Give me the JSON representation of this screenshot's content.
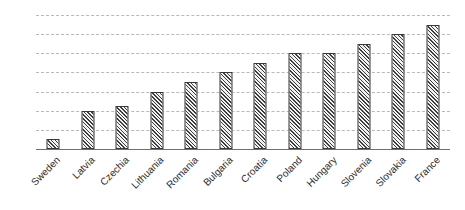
{
  "chart_data": {
    "type": "bar",
    "title": "",
    "subtitle": "",
    "xlabel": "",
    "ylabel": "",
    "categories": [
      "Sweden",
      "Latvia",
      "Czechia",
      "Lithuania",
      "Romania",
      "Bulgaria",
      "Croatia",
      "Poland",
      "Hungary",
      "Slovenia",
      "Slovakia",
      "France"
    ],
    "values": [
      1,
      4,
      4.5,
      6,
      7,
      8,
      9,
      10,
      10,
      11,
      12,
      13
    ],
    "ylim": [
      0,
      14
    ],
    "ytick_values": [
      0,
      2,
      4,
      6,
      8,
      10,
      12,
      14
    ],
    "ytick_labels": [
      "0",
      "2",
      "4",
      "6",
      "8",
      "10",
      "12",
      "14"
    ],
    "grid": "horizontal-dashed",
    "legend": "none",
    "annotations": [],
    "series": [
      {
        "name": "",
        "values": [
          1,
          4,
          4.5,
          6,
          7,
          8,
          9,
          10,
          10,
          11,
          12,
          13
        ]
      }
    ]
  },
  "style": {
    "bar_fill": "#f2f2f2",
    "bar_hatch_color": "#3d3d3d",
    "bar_border": "#3a3a3a",
    "gridline_color": "#b9b9b9",
    "axis_color": "#6f6f6f",
    "text_color": "#2b2b2b",
    "background": "#ffffff"
  }
}
